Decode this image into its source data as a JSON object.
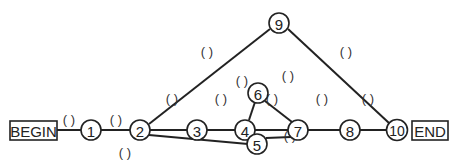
{
  "diagram": {
    "type": "network-activity-diagram",
    "begin_label": "BEGIN",
    "end_label": "END",
    "nodes": [
      {
        "id": "1",
        "label": "1"
      },
      {
        "id": "2",
        "label": "2"
      },
      {
        "id": "3",
        "label": "3"
      },
      {
        "id": "4",
        "label": "4"
      },
      {
        "id": "5",
        "label": "5"
      },
      {
        "id": "6",
        "label": "6"
      },
      {
        "id": "7",
        "label": "7"
      },
      {
        "id": "8",
        "label": "8"
      },
      {
        "id": "9",
        "label": "9"
      },
      {
        "id": "10",
        "label": "10"
      }
    ],
    "edges": [
      {
        "from": "BEGIN",
        "to": "1",
        "label": "( )"
      },
      {
        "from": "1",
        "to": "2",
        "label": "( )"
      },
      {
        "from": "2",
        "to": "9",
        "label": "( )"
      },
      {
        "from": "2",
        "to": "3",
        "label": "( )"
      },
      {
        "from": "2",
        "to": "5",
        "label": "( )"
      },
      {
        "from": "3",
        "to": "4",
        "label": "( )"
      },
      {
        "from": "4",
        "to": "6",
        "label": "( )"
      },
      {
        "from": "4",
        "to": "7",
        "label": "( )"
      },
      {
        "from": "6",
        "to": "7",
        "label": "( )"
      },
      {
        "from": "5",
        "to": "7",
        "label": "( )"
      },
      {
        "from": "7",
        "to": "8",
        "label": "( )"
      },
      {
        "from": "8",
        "to": "10",
        "label": "( )"
      },
      {
        "from": "9",
        "to": "10",
        "label": "( )"
      },
      {
        "from": "10",
        "to": "END",
        "label": ""
      }
    ]
  }
}
